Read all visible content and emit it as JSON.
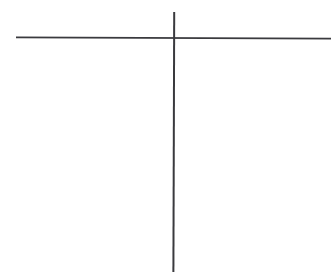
{
  "figure": {
    "title": "Cross / Axis Line Drawing",
    "background_color": "#ffffff",
    "width": 335,
    "height": 273
  },
  "chart_data": {
    "type": "line",
    "title": "",
    "subtitle": "",
    "xlabel": "",
    "ylabel": "",
    "grid": false,
    "legend": false,
    "legend_position": "none",
    "annotations": [],
    "tick_labels": {
      "x": [],
      "y": []
    },
    "series": [
      {
        "name": "horizontal-axis",
        "orientation": "horizontal",
        "color": "#3a3a3e",
        "stroke_width": 1.6,
        "x": [
          16,
          331
        ],
        "y": [
          37.4,
          38.6
        ]
      },
      {
        "name": "vertical-axis",
        "orientation": "vertical",
        "color": "#3a3a3e",
        "stroke_width": 2.0,
        "x": [
          174.2,
          173.4
        ],
        "y": [
          12,
          272
        ]
      }
    ],
    "intersection": {
      "x": 174,
      "y": 38
    },
    "xlim": [
      0,
      335
    ],
    "ylim": [
      0,
      273
    ]
  },
  "axes": {
    "horizontal": {
      "label": "horizontal-axis-line",
      "start_x": 16,
      "start_y": 37.4,
      "end_x": 331,
      "end_y": 38.6,
      "color": "#3a3a3e",
      "width": 1.6
    },
    "vertical": {
      "label": "vertical-axis-line",
      "start_x": 174.2,
      "start_y": 12,
      "end_x": 173.4,
      "end_y": 272,
      "color": "#3a3a3e",
      "width": 2.0
    },
    "intersection_label": "axis-intersection"
  },
  "quadrants": [
    {
      "name": "upper-left",
      "content": ""
    },
    {
      "name": "upper-right",
      "content": ""
    },
    {
      "name": "lower-left",
      "content": ""
    },
    {
      "name": "lower-right",
      "content": ""
    }
  ]
}
